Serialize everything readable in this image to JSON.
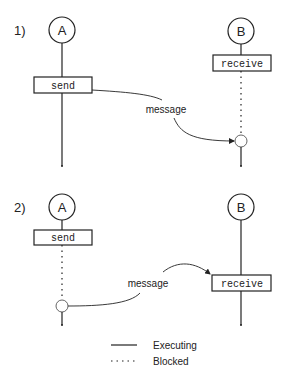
{
  "panels": [
    {
      "label": "1)",
      "process_a": {
        "name": "A",
        "call": "send"
      },
      "process_b": {
        "name": "B",
        "call": "receive"
      },
      "message_label": "message"
    },
    {
      "label": "2)",
      "process_a": {
        "name": "A",
        "call": "send"
      },
      "process_b": {
        "name": "B",
        "call": "receive"
      },
      "message_label": "message"
    }
  ],
  "legend": {
    "executing": "Executing",
    "blocked": "Blocked"
  },
  "colors": {
    "ink": "#222222",
    "background": "#ffffff"
  }
}
